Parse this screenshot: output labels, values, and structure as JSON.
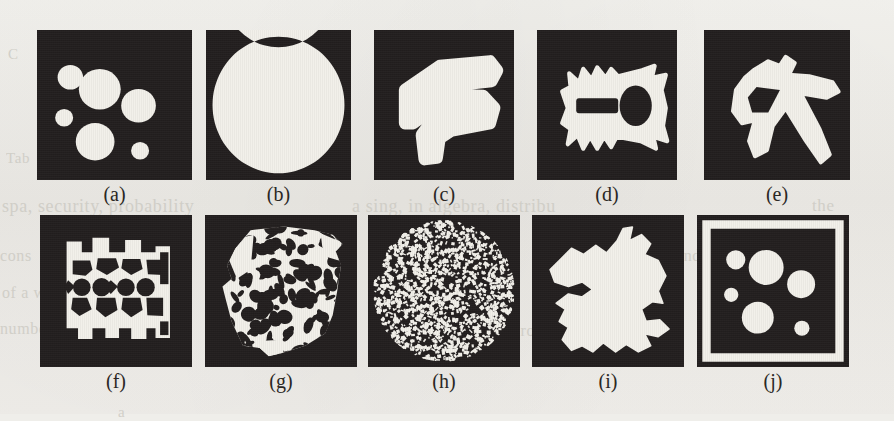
{
  "figure": {
    "kind": "binary-shape-gallery",
    "background_color": "#efeeea",
    "panel_background_color": "#231f1f",
    "foreground_color": "#f2f0ea",
    "rows": 2,
    "columns": 5,
    "panel_count": 10
  },
  "ghost_text": [
    {
      "text": "C",
      "x": 8,
      "y": 46,
      "size": 15
    },
    {
      "text": "the",
      "x": 214,
      "y": 72,
      "size": 16
    },
    {
      "text": "Tab",
      "x": 6,
      "y": 150,
      "size": 15
    },
    {
      "text": "spa, security, probability",
      "x": 2,
      "y": 196,
      "size": 18
    },
    {
      "text": "a sing, in algebra, distribu",
      "x": 352,
      "y": 196,
      "size": 18
    },
    {
      "text": "the",
      "x": 812,
      "y": 196,
      "size": 17
    },
    {
      "text": "cons",
      "x": 0,
      "y": 247,
      "size": 16
    },
    {
      "text": "of a w",
      "x": 2,
      "y": 284,
      "size": 16
    },
    {
      "text": "numbe",
      "x": 0,
      "y": 320,
      "size": 16
    },
    {
      "text": "and",
      "x": 676,
      "y": 247,
      "size": 16
    },
    {
      "text": "wit",
      "x": 700,
      "y": 286,
      "size": 16
    },
    {
      "text": "proble",
      "x": 512,
      "y": 322,
      "size": 16
    },
    {
      "text": "to",
      "x": 662,
      "y": 322,
      "size": 16
    },
    {
      "text": "a",
      "x": 118,
      "y": 404,
      "size": 15
    }
  ],
  "panels": [
    {
      "id": "a",
      "label": "(a)",
      "description": "six white discs of varying size scattered on a dark square",
      "frame": {
        "x": 37,
        "y": 30,
        "w": 155,
        "h": 150
      },
      "caption": {
        "x": 37,
        "w": 155,
        "y": 184
      },
      "shape_type": "discs",
      "discs": [
        {
          "cx": 0.215,
          "cy": 0.315,
          "r": 0.082
        },
        {
          "cx": 0.405,
          "cy": 0.395,
          "r": 0.135
        },
        {
          "cx": 0.655,
          "cy": 0.505,
          "r": 0.112
        },
        {
          "cx": 0.175,
          "cy": 0.585,
          "r": 0.058
        },
        {
          "cx": 0.375,
          "cy": 0.745,
          "r": 0.125
        },
        {
          "cx": 0.665,
          "cy": 0.805,
          "r": 0.058
        }
      ]
    },
    {
      "id": "b",
      "label": "(b)",
      "description": "white annulus (ring) with a solid white disc at its centre",
      "frame": {
        "x": 206,
        "y": 30,
        "w": 145,
        "h": 150
      },
      "caption": {
        "x": 206,
        "w": 145,
        "y": 184
      },
      "shape_type": "ring-and-disc",
      "ring": {
        "cx": 0.5,
        "cy": 0.5,
        "r_outer": 0.455,
        "r_inner": 0.385
      },
      "disc": {
        "cx": 0.5,
        "cy": 0.5,
        "r": 0.232
      }
    },
    {
      "id": "c",
      "label": "(c)",
      "description": "thick white stroke forming a stylised fish / S glyph",
      "frame": {
        "x": 374,
        "y": 30,
        "w": 140,
        "h": 150
      },
      "caption": {
        "x": 374,
        "w": 140,
        "y": 184
      },
      "shape_type": "glyph",
      "path": "M 0.22 0.40 L 0.47 0.24 L 0.83 0.21 L 0.88 0.27 L 0.84 0.34 L 0.55 0.37 L 0.42 0.43 L 0.78 0.44 L 0.86 0.52 L 0.83 0.62 L 0.55 0.67 L 0.47 0.72 L 0.45 0.85 L 0.36 0.86 L 0.34 0.70 L 0.42 0.60 L 0.70 0.56 L 0.40 0.54 L 0.28 0.62 L 0.22 0.62 Z"
    },
    {
      "id": "d",
      "label": "(d)",
      "description": "white fish/key shape with a dark elliptical eye hole and a dark bar slot",
      "frame": {
        "x": 537,
        "y": 30,
        "w": 140,
        "h": 150
      },
      "caption": {
        "x": 537,
        "w": 140,
        "y": 184
      },
      "shape_type": "glyph-with-holes",
      "path": "M 0.23 0.29 L 0.30 0.35 L 0.33 0.26 L 0.39 0.33 L 0.43 0.25 L 0.49 0.32 L 0.53 0.26 L 0.58 0.31 L 0.75 0.27 L 0.84 0.24 L 0.82 0.32 L 0.92 0.30 L 0.89 0.40 L 0.92 0.52 L 0.90 0.64 L 0.93 0.74 L 0.83 0.71 L 0.85 0.79 L 0.74 0.74 L 0.57 0.71 L 0.53 0.78 L 0.48 0.71 L 0.43 0.79 L 0.38 0.71 L 0.33 0.79 L 0.29 0.70 L 0.22 0.76 L 0.24 0.66 L 0.18 0.62 L 0.22 0.52 L 0.18 0.41 L 0.24 0.38 Z",
      "holes": [
        {
          "type": "ellipse",
          "cx": 0.705,
          "cy": 0.505,
          "rx": 0.115,
          "ry": 0.135
        },
        {
          "type": "rect",
          "x": 0.28,
          "y": 0.455,
          "w": 0.3,
          "h": 0.1,
          "rx": 0.02
        }
      ]
    },
    {
      "id": "e",
      "label": "(e)",
      "description": "white pick-axe / hammer shape with a dark triangular hole",
      "frame": {
        "x": 704,
        "y": 30,
        "w": 146,
        "h": 150
      },
      "caption": {
        "x": 704,
        "w": 146,
        "y": 184
      },
      "shape_type": "glyph-with-holes",
      "path": "M 0.34 0.27 L 0.44 0.21 L 0.52 0.24 L 0.56 0.18 L 0.62 0.22 L 0.58 0.30 L 0.72 0.31 L 0.88 0.35 L 0.92 0.41 L 0.84 0.45 L 0.66 0.42 L 0.79 0.66 L 0.86 0.83 L 0.80 0.88 L 0.70 0.74 L 0.56 0.52 L 0.47 0.64 L 0.43 0.80 L 0.35 0.84 L 0.31 0.74 L 0.35 0.60 L 0.26 0.62 L 0.20 0.54 L 0.22 0.40 L 0.28 0.32 Z",
      "holes": [
        {
          "type": "path",
          "d": "M 0.36 0.38 L 0.52 0.40 L 0.44 0.55 L 0.33 0.55 L 0.30 0.45 Z"
        }
      ]
    },
    {
      "id": "f",
      "label": "(f)",
      "description": "white outline of an engine-block / cylinder-head casting with four dark circular bores",
      "frame": {
        "x": 40,
        "y": 215,
        "w": 152,
        "h": 152
      },
      "caption": {
        "x": 40,
        "w": 152,
        "y": 371
      },
      "shape_type": "mechanical-part",
      "bores": [
        {
          "cx": 0.275,
          "cy": 0.475,
          "r": 0.058
        },
        {
          "cx": 0.405,
          "cy": 0.475,
          "r": 0.06
        },
        {
          "cx": 0.565,
          "cy": 0.475,
          "r": 0.058
        },
        {
          "cx": 0.695,
          "cy": 0.475,
          "r": 0.06
        }
      ]
    },
    {
      "id": "g",
      "label": "(g)",
      "description": "porous trabecular bone cross-section, white matrix pierced by many dark pores",
      "frame": {
        "x": 205,
        "y": 215,
        "w": 152,
        "h": 152
      },
      "caption": {
        "x": 205,
        "w": 152,
        "y": 371
      },
      "shape_type": "porous-texture",
      "pore_count": 150
    },
    {
      "id": "h",
      "label": "(h)",
      "description": "circular disc filled with fine random salt-and-pepper speckle noise",
      "frame": {
        "x": 368,
        "y": 215,
        "w": 152,
        "h": 152
      },
      "caption": {
        "x": 368,
        "w": 152,
        "y": 371
      },
      "shape_type": "speckle-disc",
      "speck_count": 1400,
      "disc": {
        "cx": 0.5,
        "cy": 0.5,
        "r": 0.465
      }
    },
    {
      "id": "i",
      "label": "(i)",
      "description": "single large irregular white blob with a ragged coastline-like boundary",
      "frame": {
        "x": 532,
        "y": 215,
        "w": 152,
        "h": 152
      },
      "caption": {
        "x": 532,
        "w": 152,
        "y": 371
      },
      "shape_type": "irregular-blob",
      "path": "M 0.18 0.30 L 0.26 0.22 L 0.34 0.26 L 0.42 0.20 L 0.49 0.25 L 0.56 0.17 L 0.60 0.09 L 0.66 0.08 L 0.64 0.17 L 0.72 0.13 L 0.78 0.19 L 0.74 0.26 L 0.83 0.30 L 0.88 0.40 L 0.83 0.50 L 0.86 0.58 L 0.79 0.57 L 0.72 0.62 L 0.75 0.70 L 0.84 0.69 L 0.90 0.75 L 0.83 0.80 L 0.74 0.78 L 0.78 0.86 L 0.70 0.90 L 0.62 0.85 L 0.55 0.90 L 0.47 0.84 L 0.40 0.90 L 0.33 0.86 L 0.26 0.89 L 0.20 0.82 L 0.24 0.74 L 0.18 0.70 L 0.22 0.62 L 0.16 0.58 L 0.24 0.52 L 0.33 0.54 L 0.40 0.49 L 0.33 0.44 L 0.24 0.47 L 0.15 0.44 L 0.12 0.36 Z"
    },
    {
      "id": "j",
      "label": "(j)",
      "description": "same six discs as panel (a) but enclosed by a white rectangular frame",
      "frame": {
        "x": 697,
        "y": 215,
        "w": 152,
        "h": 152
      },
      "caption": {
        "x": 697,
        "w": 152,
        "y": 371
      },
      "shape_type": "discs-with-border",
      "border": {
        "outer_inset": 0.035,
        "thickness": 0.055
      },
      "discs": [
        {
          "cx": 0.255,
          "cy": 0.295,
          "r": 0.063
        },
        {
          "cx": 0.455,
          "cy": 0.345,
          "r": 0.115
        },
        {
          "cx": 0.685,
          "cy": 0.455,
          "r": 0.092
        },
        {
          "cx": 0.225,
          "cy": 0.525,
          "r": 0.047
        },
        {
          "cx": 0.4,
          "cy": 0.675,
          "r": 0.105
        },
        {
          "cx": 0.69,
          "cy": 0.745,
          "r": 0.05
        }
      ]
    }
  ]
}
